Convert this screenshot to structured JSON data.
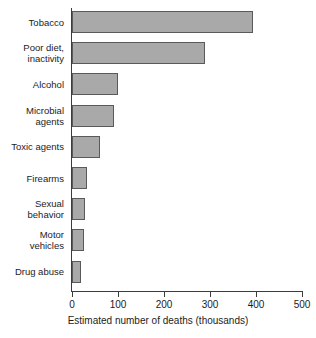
{
  "chart_data": {
    "type": "bar",
    "orientation": "horizontal",
    "title": "",
    "xlabel": "Estimated number of deaths (thousands)",
    "ylabel": "",
    "xlim": [
      0,
      500
    ],
    "xticks": [
      0,
      100,
      200,
      300,
      400,
      500
    ],
    "xtick_labels": [
      "0",
      "100",
      "200",
      "300",
      "400",
      "500"
    ],
    "grid": false,
    "legend": null,
    "bar_color": "#a9a9a9",
    "bar_edge_color": "#5a5a5a",
    "axis_color": "#3c3c3c",
    "categories": [
      "Tobacco",
      "Poor diet,\ninactivity",
      "Alcohol",
      "Microbial\nagents",
      "Toxic agents",
      "Firearms",
      "Sexual\nbehavior",
      "Motor\nvehicles",
      "Drug abuse"
    ],
    "values": [
      393,
      289,
      100,
      91,
      60,
      32,
      28,
      25,
      20
    ]
  }
}
